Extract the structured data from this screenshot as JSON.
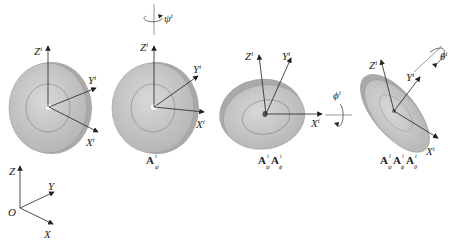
{
  "diagram": {
    "type": "rotation-sequence",
    "colors": {
      "disc_face": "#c9c9c9",
      "disc_edge": "#a8a8a8",
      "axis": "#222222",
      "background": "#ffffff"
    },
    "stages": [
      {
        "id": "initial",
        "axes": [
          "Zi",
          "Yi",
          "Xi"
        ],
        "caption": ""
      },
      {
        "id": "psi",
        "axes": [
          "Zi",
          "Yi",
          "Xi"
        ],
        "rotation_label": "ψi",
        "caption": "Aψi"
      },
      {
        "id": "psi-phi",
        "axes": [
          "Zi",
          "Yi",
          "Xi"
        ],
        "rotation_label": "ϕi",
        "caption": "AψiAϕi"
      },
      {
        "id": "psi-phi-theta",
        "axes": [
          "Zi",
          "Yi",
          "Xi"
        ],
        "rotation_label": "θi",
        "caption": "AψiAϕiAθi"
      }
    ],
    "global_frame": {
      "origin": "O",
      "axes": [
        "Z",
        "Y",
        "X"
      ]
    }
  },
  "labels": {
    "Z": "Z",
    "Y": "Y",
    "X": "X",
    "O": "O",
    "i": "i",
    "psi": "ψ",
    "phi": "ϕ",
    "theta": "θ",
    "A": "A"
  }
}
